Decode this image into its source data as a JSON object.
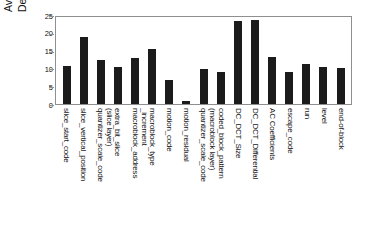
{
  "chart_data": {
    "type": "bar",
    "title": "",
    "xlabel": "",
    "ylabel": "Average PSNR Degradation (dB)",
    "ylabel_lines": [
      "Average PSNR",
      "Degradation (dB)"
    ],
    "ylim": [
      0,
      25
    ],
    "yticks": [
      25,
      20,
      15,
      10,
      5,
      0
    ],
    "grid": false,
    "legend": "none",
    "bar_color": "#1b1b1b",
    "categories": [
      "slice_start_code",
      "slice_vertical_position",
      "quantizer_scale_code (slice layer)",
      "extra_bit_slice",
      "macroblock_address_increment",
      "macroblock_type",
      "motion_code",
      "motion_residual",
      "quantizer_scale_code (macroblock layer)",
      "coded_block_pattern",
      "DC_DCT_Size",
      "DC_DCT_Differential",
      "AC Coefficients",
      "escape_code",
      "run",
      "level",
      "end-of-block"
    ],
    "category_lines": [
      [
        "slice_start_code"
      ],
      [
        "slice_vertical_position"
      ],
      [
        "quantizer_scale_code",
        "(slice layer)"
      ],
      [
        "extra_bit_slice"
      ],
      [
        "macroblock_address",
        "_increment"
      ],
      [
        "macroblock_type"
      ],
      [
        "motion_code"
      ],
      [
        "motion_residual"
      ],
      [
        "quantizer_scale_code",
        "(macroblock layer)"
      ],
      [
        "coded_block_pattern"
      ],
      [
        "DC_DCT_Size"
      ],
      [
        "DC_DCT_Differential"
      ],
      [
        "AC Coefficients"
      ],
      [
        "escape_code"
      ],
      [
        "run"
      ],
      [
        "level"
      ],
      [
        "end-of-block"
      ]
    ],
    "values": [
      10.8,
      19.3,
      12.6,
      10.7,
      13.2,
      15.8,
      7.0,
      1.0,
      10.1,
      9.3,
      23.8,
      24.1,
      13.6,
      9.2,
      11.5,
      10.5,
      10.4
    ]
  }
}
